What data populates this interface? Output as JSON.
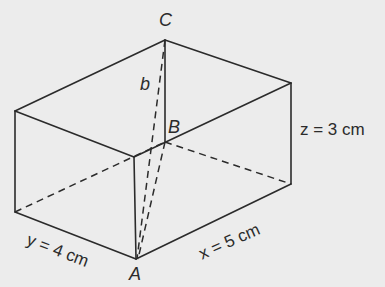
{
  "figure": {
    "type": "cuboid-space-diagonal",
    "vertices": {
      "C": "C",
      "B": "B",
      "A": "A"
    },
    "labels": {
      "diagonal": "b",
      "x_label": "x = 5 cm",
      "y_label": "y = 4 cm",
      "z_label": "z = 3 cm"
    },
    "dimensions": {
      "x": {
        "var": "x",
        "value": 5,
        "unit": "cm"
      },
      "y": {
        "var": "y",
        "value": 4,
        "unit": "cm"
      },
      "z": {
        "var": "z",
        "value": 3,
        "unit": "cm"
      }
    },
    "colors": {
      "background": "#ececec",
      "line": "#2b2b2b"
    }
  }
}
